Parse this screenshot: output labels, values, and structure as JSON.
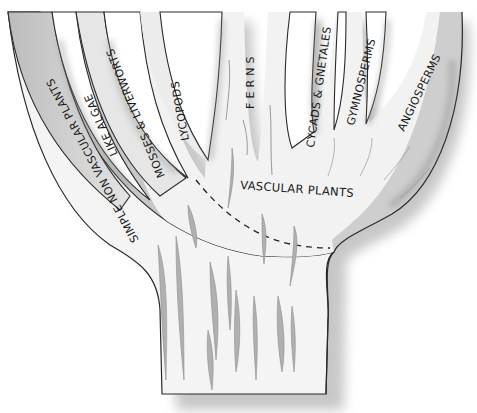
{
  "diagram": {
    "type": "evolutionary-tree",
    "colors": {
      "trunk_fill": "#f4f4f4",
      "outer_branch_fill": "#c9c9c9",
      "outline": "#2a2a2a",
      "shadow": "#bdbdbd",
      "grain": "#a8a8a8",
      "background": "#ffffff"
    },
    "branches": [
      {
        "id": "nonvascular",
        "label_line1": "SIMPLE NON VASCULAR PLANTS",
        "label_line2": "LIKE ALGAE"
      },
      {
        "id": "mosses",
        "label": "MOSSES & LIVERWORTS"
      },
      {
        "id": "lycopods",
        "label": "LYCOPODS"
      },
      {
        "id": "ferns",
        "label": "F E R N S"
      },
      {
        "id": "cycads",
        "label": "CYCADS & GNETALES"
      },
      {
        "id": "gymnosperms",
        "label": "GYMNOSPERMS"
      },
      {
        "id": "angiosperms",
        "label": "ANGIOSPERMS"
      }
    ],
    "group_label": "VASCULAR PLANTS",
    "divider": "dashed-line"
  }
}
